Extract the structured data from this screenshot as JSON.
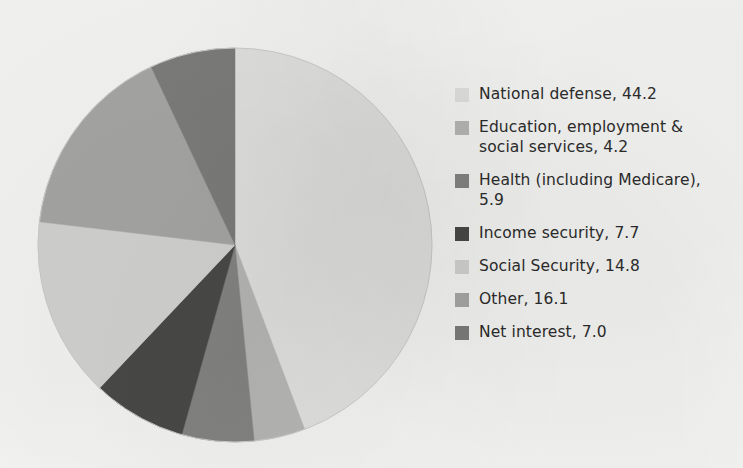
{
  "chart_data": {
    "type": "pie",
    "title": "",
    "subtitle": "",
    "xlabel": "",
    "ylabel": "",
    "unit": "percent",
    "legend_position": "right",
    "start_angle_deg": 0,
    "direction": "clockwise",
    "categories": [
      "National defense",
      "Education, employment & social services",
      "Health (including Medicare)",
      "Income security",
      "Social Security",
      "Other",
      "Net interest"
    ],
    "values": [
      44.2,
      4.2,
      5.9,
      7.7,
      14.8,
      16.1,
      7.0
    ],
    "colors": [
      "#e3e3e1",
      "#b9b9b7",
      "#868684",
      "#4a4a48",
      "#d5d5d3",
      "#a8a8a6",
      "#7e7e7c"
    ],
    "total": 99.9
  },
  "legend": {
    "items": [
      {
        "label": "National defense, 44.2",
        "color": "#e3e3e1",
        "swatch_name": "legend-swatch-national-defense"
      },
      {
        "label": "Education, employment &\nsocial services, 4.2",
        "color": "#b9b9b7",
        "swatch_name": "legend-swatch-education"
      },
      {
        "label": "Health (including Medicare),\n5.9",
        "color": "#868684",
        "swatch_name": "legend-swatch-health"
      },
      {
        "label": "Income security, 7.7",
        "color": "#4a4a48",
        "swatch_name": "legend-swatch-income-security"
      },
      {
        "label": "Social Security, 14.8",
        "color": "#d5d5d3",
        "swatch_name": "legend-swatch-social-security"
      },
      {
        "label": "Other, 16.1",
        "color": "#a8a8a6",
        "swatch_name": "legend-swatch-other"
      },
      {
        "label": "Net interest, 7.0",
        "color": "#7e7e7c",
        "swatch_name": "legend-swatch-net-interest"
      }
    ]
  },
  "theme": {
    "background": "#f7f7f5",
    "text_color": "#2c2c2c",
    "pie_outline": "#cfcfcd"
  }
}
